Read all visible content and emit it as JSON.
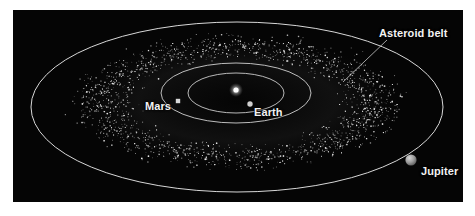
{
  "figure": {
    "background_color": "#ffffff",
    "panel_color": "#050505",
    "panel": {
      "x": 13,
      "y": 10,
      "width": 450,
      "height": 192
    }
  },
  "labels": {
    "mars": "Mars",
    "earth": "Earth",
    "jupiter": "Jupiter",
    "asteroid_belt": "Asteroid belt"
  },
  "colors": {
    "orbit_line": "#d8d8d8",
    "sun": "#ffffff",
    "earth_marker": "#cfcfcf",
    "mars_marker": "#d5d5d5",
    "jupiter_body": "#9a9a9a",
    "asteroid": "#e8e8e8",
    "label_text": "#f2f2f2",
    "leader_line": "#c8c8c8"
  },
  "chart_data": {
    "type": "scatter",
    "title": "",
    "subtitle": "",
    "xlabel": "",
    "ylabel": "",
    "view": "Oblique (inclined) view of the inner solar system showing the asteroid belt between the orbits of Mars and Jupiter",
    "projection": "elliptical perspective, orbits drawn as concentric ellipses",
    "grid": false,
    "legend": false,
    "sun": {
      "label": "Sun",
      "cx": 223,
      "cy": 80,
      "r": 2.6
    },
    "orbits": [
      {
        "name": "Earth orbit",
        "body": "Earth",
        "cx": 223,
        "cy": 83,
        "rx": 48,
        "ry": 20
      },
      {
        "name": "Mars orbit",
        "body": "Mars",
        "cx": 223,
        "cy": 83,
        "rx": 75,
        "ry": 30
      },
      {
        "name": "Jupiter orbit",
        "body": "Jupiter",
        "cx": 224,
        "cy": 97,
        "rx": 206,
        "ry": 85
      }
    ],
    "bodies": [
      {
        "name": "Earth",
        "marker": "dot",
        "cx": 237,
        "cy": 94,
        "r": 2.6,
        "label": "Earth"
      },
      {
        "name": "Mars",
        "marker": "square",
        "cx": 165,
        "cy": 91,
        "size": 4,
        "label": "Mars"
      },
      {
        "name": "Jupiter",
        "marker": "sphere",
        "cx": 398,
        "cy": 150,
        "r": 5.5,
        "label": "Jupiter"
      }
    ],
    "annotations": [
      {
        "text": "Asteroid belt",
        "x": 366,
        "y": 18,
        "leader_from": [
          374,
          30
        ],
        "leader_to": [
          330,
          72
        ]
      }
    ],
    "asteroid_belt": {
      "label": "Asteroid belt",
      "description": "Dense torus of small rocky bodies between Mars and Jupiter orbits",
      "inner_rx": 92,
      "inner_ry": 37,
      "outer_rx": 182,
      "outer_ry": 74,
      "center": [
        224,
        92
      ],
      "point_count": 2600
    }
  }
}
